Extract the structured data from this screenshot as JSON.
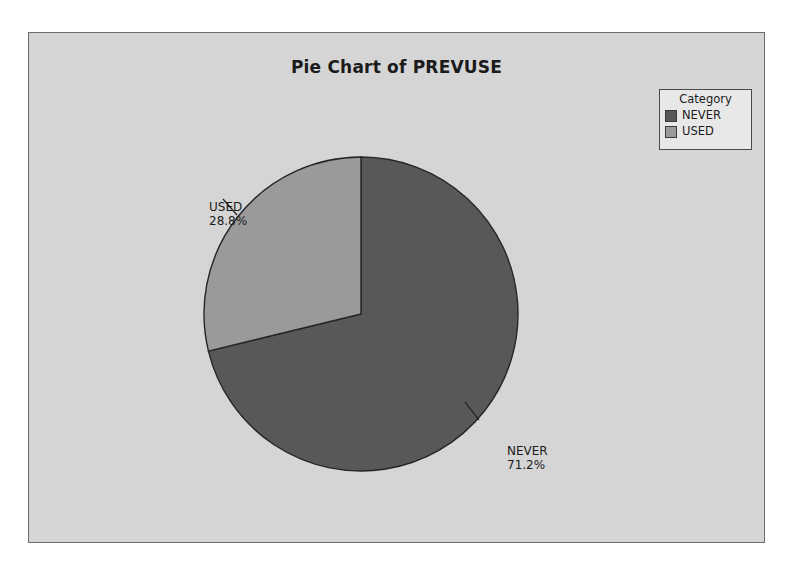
{
  "chart_data": {
    "type": "pie",
    "title": "Pie Chart of PREVUSE",
    "legend_title": "Category",
    "legend_position": "top-right",
    "start_angle_deg": 0,
    "direction": "clockwise",
    "categories": [
      "NEVER",
      "USED"
    ],
    "values": [
      71.2,
      28.8
    ],
    "labels": [
      {
        "name": "NEVER",
        "value_text": "71.2%",
        "color": "#585858"
      },
      {
        "name": "USED",
        "value_text": "28.8%",
        "color": "#9a9a9a"
      }
    ],
    "xlabel": "",
    "ylabel": ""
  },
  "figure": {
    "background": "#d5d5d5",
    "border_color": "#6b6b6b",
    "page_background": "#ffffff"
  },
  "legend": {
    "title": "Category",
    "items": [
      {
        "label": "NEVER",
        "color": "#585858"
      },
      {
        "label": "USED",
        "color": "#9a9a9a"
      }
    ]
  },
  "pie": {
    "center_x": 360,
    "center_y": 313,
    "radius": 157,
    "slices": [
      {
        "name": "NEVER",
        "percent_text": "71.2%",
        "percent": 71.2,
        "color": "#585858"
      },
      {
        "name": "USED",
        "percent_text": "28.8%",
        "percent": 28.8,
        "color": "#9a9a9a"
      }
    ]
  }
}
